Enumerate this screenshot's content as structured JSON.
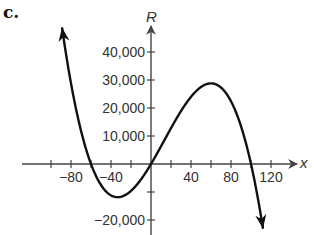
{
  "part_label": "c.",
  "chart_data": {
    "type": "line",
    "title": "",
    "xlabel": "x",
    "ylabel": "R",
    "function": "R = -0.1x(x+60)(x-100)",
    "x_ticks": [
      -100,
      -80,
      -60,
      -40,
      -20,
      20,
      40,
      60,
      80,
      100,
      120
    ],
    "x_tick_labels": [
      {
        "value": -80,
        "label": "−80"
      },
      {
        "value": -40,
        "label": "−40"
      },
      {
        "value": 40,
        "label": "40"
      },
      {
        "value": 80,
        "label": "80"
      },
      {
        "value": 120,
        "label": "120"
      }
    ],
    "y_ticks": [
      -20000,
      -10000,
      10000,
      20000,
      30000,
      40000
    ],
    "y_tick_labels": [
      {
        "value": 40000,
        "label": "40,000"
      },
      {
        "value": 30000,
        "label": "30,000"
      },
      {
        "value": 20000,
        "label": "20,000"
      },
      {
        "value": 10000,
        "label": "10,000"
      },
      {
        "value": -20000,
        "label": "−20,000"
      }
    ],
    "xlim": [
      -100,
      140
    ],
    "ylim": [
      -25000,
      45000
    ],
    "grid": false,
    "key_points": {
      "roots": [
        -60,
        0,
        100
      ],
      "local_min": {
        "x": -33,
        "y": -11850
      },
      "local_max": {
        "x": 60,
        "y": 28800
      }
    },
    "series": [
      {
        "name": "R",
        "x": [
          -89,
          -80,
          -70,
          -60,
          -50,
          -40,
          -33,
          -20,
          -10,
          0,
          10,
          20,
          30,
          40,
          50,
          60,
          70,
          80,
          90,
          100,
          110,
          112
        ],
        "y": [
          48781,
          28800,
          13300,
          0,
          -7500,
          -11200,
          -11850,
          -9600,
          -5500,
          0,
          6300,
          12800,
          18900,
          24000,
          27500,
          28800,
          27300,
          22400,
          13500,
          0,
          -18700,
          -23117
        ]
      }
    ]
  }
}
